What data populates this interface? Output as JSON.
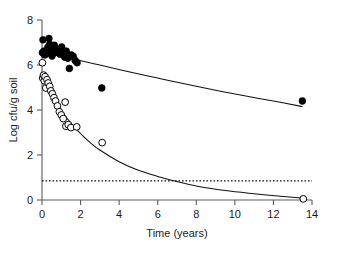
{
  "chart_data": {
    "type": "scatter",
    "title": "",
    "xlabel": "Time (years)",
    "ylabel": "Log cfu/g soil",
    "xlim": [
      0,
      14
    ],
    "ylim": [
      0,
      8
    ],
    "xticks": [
      0,
      2,
      4,
      6,
      8,
      10,
      12,
      14
    ],
    "yticks": [
      0,
      2,
      4,
      6,
      8
    ],
    "xtick_labels": [
      "0",
      "2",
      "4",
      "6",
      "8",
      "10",
      "12",
      "14"
    ],
    "ytick_labels": [
      "0",
      "2",
      "4",
      "6",
      "8"
    ],
    "grid": false,
    "legend": "none",
    "series": [
      {
        "name": "filled-circles",
        "marker": "filled circle",
        "color": "#000000",
        "points": [
          [
            0.02,
            6.55
          ],
          [
            0.05,
            7.12
          ],
          [
            0.1,
            6.62
          ],
          [
            0.14,
            6.45
          ],
          [
            0.22,
            6.5
          ],
          [
            0.3,
            6.78
          ],
          [
            0.36,
            7.18
          ],
          [
            0.4,
            6.92
          ],
          [
            0.46,
            6.6
          ],
          [
            0.52,
            6.4
          ],
          [
            0.58,
            6.72
          ],
          [
            0.64,
            6.88
          ],
          [
            0.7,
            6.55
          ],
          [
            0.78,
            6.7
          ],
          [
            0.86,
            6.62
          ],
          [
            0.94,
            6.48
          ],
          [
            1.02,
            6.8
          ],
          [
            1.1,
            6.55
          ],
          [
            1.18,
            6.35
          ],
          [
            1.26,
            6.62
          ],
          [
            1.34,
            6.3
          ],
          [
            1.42,
            5.85
          ],
          [
            1.52,
            6.45
          ],
          [
            1.62,
            6.38
          ],
          [
            1.72,
            6.2
          ],
          [
            1.82,
            6.1
          ],
          [
            3.1,
            4.98
          ],
          [
            13.5,
            4.4
          ]
        ]
      },
      {
        "name": "open-circles",
        "marker": "open circle",
        "color": "#ffffff",
        "points": [
          [
            0.02,
            6.1
          ],
          [
            0.04,
            5.42
          ],
          [
            0.08,
            5.55
          ],
          [
            0.12,
            5.3
          ],
          [
            0.16,
            5.48
          ],
          [
            0.2,
            4.98
          ],
          [
            0.26,
            5.35
          ],
          [
            0.32,
            5.2
          ],
          [
            0.4,
            5.05
          ],
          [
            0.46,
            4.85
          ],
          [
            0.54,
            4.72
          ],
          [
            0.62,
            4.55
          ],
          [
            0.7,
            4.4
          ],
          [
            0.8,
            4.18
          ],
          [
            0.9,
            3.92
          ],
          [
            1.0,
            3.78
          ],
          [
            1.1,
            3.62
          ],
          [
            1.2,
            4.35
          ],
          [
            1.24,
            3.28
          ],
          [
            1.36,
            3.35
          ],
          [
            1.5,
            3.22
          ],
          [
            1.8,
            3.25
          ],
          [
            3.12,
            2.55
          ],
          [
            13.55,
            0.05
          ]
        ]
      }
    ],
    "fit_curves": [
      {
        "name": "upper-fit",
        "description": "slow exponential decline through filled circles",
        "style": "solid",
        "points": [
          [
            1.85,
            6.22
          ],
          [
            3.0,
            6.0
          ],
          [
            4.5,
            5.7
          ],
          [
            6.0,
            5.42
          ],
          [
            7.5,
            5.14
          ],
          [
            9.0,
            4.88
          ],
          [
            10.5,
            4.63
          ],
          [
            12.0,
            4.4
          ],
          [
            13.5,
            4.15
          ]
        ]
      },
      {
        "name": "lower-fit",
        "description": "rapid exponential decline through open circles toward asymptote",
        "style": "solid",
        "points": [
          [
            0.02,
            5.58
          ],
          [
            0.3,
            5.05
          ],
          [
            0.6,
            4.55
          ],
          [
            1.0,
            3.98
          ],
          [
            1.5,
            3.42
          ],
          [
            2.0,
            2.95
          ],
          [
            2.5,
            2.55
          ],
          [
            3.0,
            2.22
          ],
          [
            4.0,
            1.7
          ],
          [
            5.0,
            1.32
          ],
          [
            6.0,
            1.05
          ],
          [
            7.0,
            0.82
          ],
          [
            8.0,
            0.62
          ],
          [
            9.5,
            0.42
          ],
          [
            11.0,
            0.28
          ],
          [
            12.5,
            0.16
          ],
          [
            13.6,
            0.08
          ]
        ]
      }
    ],
    "reference_line": {
      "name": "detection-limit",
      "orientation": "horizontal",
      "value": 0.85,
      "style": "dotted",
      "x_from": 0,
      "x_to": 14
    }
  }
}
